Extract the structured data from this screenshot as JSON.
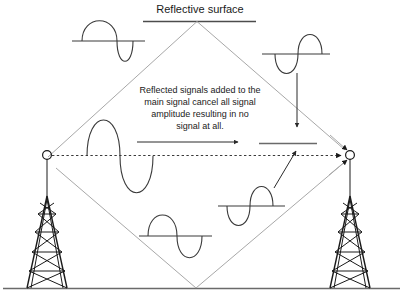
{
  "figure": {
    "title": "Reflective surface",
    "annotation_lines": [
      "Reflected signals added to the",
      "main signal cancel all signal",
      "amplitude resulting in no",
      "signal at all."
    ],
    "annotation_full": "Reflected signals added to the main signal cancel all signal amplitude resulting in no signal at all."
  },
  "colors": {
    "background": "#ffffff",
    "ink": "#1a1a1a",
    "wave": "#3a3a3a",
    "ray": "#a8a8a8",
    "ground": "#6a6a6a"
  },
  "elements": {
    "reflective_surface_label": "Reflective surface",
    "left_tower_name": "transmitting tower",
    "right_tower_name": "receiving tower",
    "ground_name": "ground line",
    "direct_path_name": "direct signal path",
    "ceiling_reflection_name": "ceiling reflected path",
    "ground_reflection_name": "ground reflected path"
  },
  "waveforms": [
    {
      "id": "wave-top-left",
      "name": "transmitted-signal-waveform",
      "phase": "positive-first",
      "description": "main transmitted signal"
    },
    {
      "id": "wave-top-right",
      "name": "ceiling-reflected-waveform",
      "phase": "negative-first",
      "description": "inverted reflected signal from reflective surface"
    },
    {
      "id": "wave-mid-left",
      "name": "direct-signal-waveform",
      "phase": "positive-first",
      "description": "direct signal along line of sight"
    },
    {
      "id": "wave-bottom-center",
      "name": "ground-path-waveform",
      "phase": "positive-first",
      "description": "signal travelling toward ground reflection"
    },
    {
      "id": "wave-mid-right",
      "name": "ground-reflected-waveform",
      "phase": "negative-first",
      "description": "inverted reflected signal from ground"
    },
    {
      "id": "flat-line-right",
      "name": "cancelled-signal-flatline",
      "phase": "none",
      "description": "resulting zero amplitude signal at receiver"
    }
  ],
  "arrows": [
    {
      "id": "arrow-main-right",
      "name": "main-signal-direction-arrow",
      "direction": "right"
    },
    {
      "id": "arrow-down-right",
      "name": "reflected-signal-down-arrow",
      "direction": "down"
    },
    {
      "id": "arrow-diagonal-up",
      "name": "ground-reflection-arrow",
      "direction": "up-right"
    },
    {
      "id": "arrow-dashed-receiver",
      "name": "direct-path-arrow",
      "direction": "right"
    },
    {
      "id": "arrow-ceiling-receiver",
      "name": "ceiling-path-arrow",
      "direction": "down-right"
    },
    {
      "id": "arrow-ground-receiver",
      "name": "ground-path-arrow",
      "direction": "up-right"
    }
  ]
}
